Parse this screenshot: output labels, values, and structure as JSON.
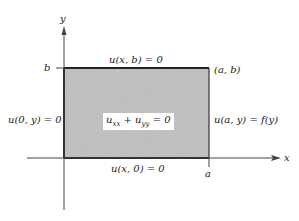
{
  "diagram": {
    "axes": {
      "x_label": "x",
      "y_label": "y",
      "x_tick_label": "a",
      "y_tick_label": "b"
    },
    "region": {
      "fill_color": "#b8b8b8",
      "corner_label": "(a, b)",
      "equation": {
        "u1": "u",
        "s1": "xx",
        "plus": " + ",
        "u2": "u",
        "s2": "yy",
        "eq": " = 0"
      }
    },
    "boundary_conditions": {
      "top": "u(x, b) = 0",
      "bottom": "u(x, 0) = 0",
      "left": "u(0, y) = 0",
      "right": "u(a, y) = f(y)"
    }
  }
}
